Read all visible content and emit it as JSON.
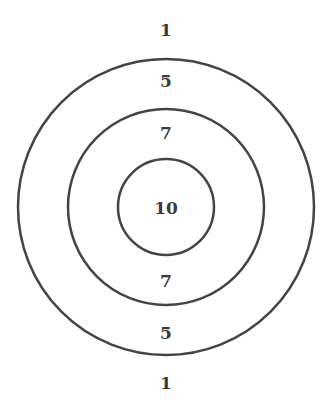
{
  "target": {
    "rings": [
      {
        "name": "outer",
        "score": "1",
        "radius": 148
      },
      {
        "name": "middle",
        "score": "5",
        "radius": 98
      },
      {
        "name": "inner",
        "score": "7",
        "radius": 48
      },
      {
        "name": "bullseye",
        "score": "10"
      }
    ],
    "labels": {
      "top_outside": "1",
      "top_outer_band": "5",
      "top_middle_band": "7",
      "center": "10",
      "bottom_middle_band": "7",
      "bottom_outer_band": "5",
      "bottom_outside": "1"
    },
    "stroke_color": "#444444",
    "text_color": "#3a3a3a"
  }
}
